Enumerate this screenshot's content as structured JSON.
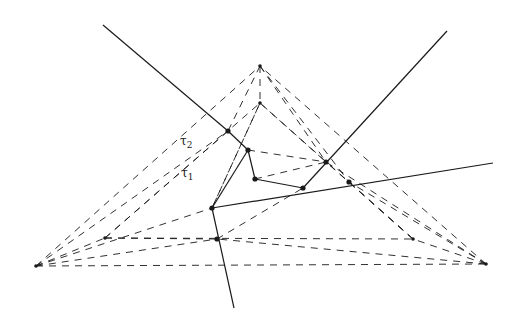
{
  "diagram": {
    "title": "",
    "colors": {
      "stroke": "#1a1a1a",
      "background": "#ffffff"
    },
    "labels": [
      {
        "id": "tau2",
        "base": "τ",
        "sub": "2",
        "x": 180,
        "y": 134
      },
      {
        "id": "tau1",
        "base": "τ",
        "sub": "1",
        "x": 181,
        "y": 166
      }
    ],
    "outer_triangle": [
      [
        36,
        266
      ],
      [
        486,
        264
      ],
      [
        260,
        66
      ]
    ],
    "inner_triangle": [
      [
        105,
        238
      ],
      [
        413,
        239
      ],
      [
        260,
        103
      ]
    ],
    "solid_lines": [
      [
        [
          103,
          25
        ],
        [
          228,
          131
        ]
      ],
      [
        [
          228,
          131
        ],
        [
          248,
          150
        ]
      ],
      [
        [
          248,
          150
        ],
        [
          255,
          179
        ]
      ],
      [
        [
          255,
          179
        ],
        [
          303,
          188
        ]
      ],
      [
        [
          447,
          31
        ],
        [
          303,
          188
        ]
      ],
      [
        [
          212,
          208
        ],
        [
          493,
          163
        ]
      ],
      [
        [
          212,
          208
        ],
        [
          248,
          150
        ]
      ],
      [
        [
          212,
          208
        ],
        [
          234,
          308
        ]
      ]
    ],
    "dashed_lines": [
      [
        [
          36,
          266
        ],
        [
          486,
          264
        ]
      ],
      [
        [
          36,
          266
        ],
        [
          260,
          66
        ]
      ],
      [
        [
          486,
          264
        ],
        [
          260,
          66
        ]
      ],
      [
        [
          105,
          238
        ],
        [
          413,
          239
        ]
      ],
      [
        [
          105,
          238
        ],
        [
          260,
          103
        ]
      ],
      [
        [
          413,
          239
        ],
        [
          260,
          103
        ]
      ],
      [
        [
          36,
          266
        ],
        [
          105,
          238
        ]
      ],
      [
        [
          486,
          264
        ],
        [
          413,
          239
        ]
      ],
      [
        [
          260,
          66
        ],
        [
          260,
          103
        ]
      ],
      [
        [
          36,
          266
        ],
        [
          228,
          131
        ]
      ],
      [
        [
          105,
          238
        ],
        [
          228,
          131
        ]
      ],
      [
        [
          260,
          66
        ],
        [
          228,
          131
        ]
      ],
      [
        [
          260,
          66
        ],
        [
          326,
          162
        ]
      ],
      [
        [
          260,
          103
        ],
        [
          212,
          208
        ]
      ],
      [
        [
          260,
          103
        ],
        [
          326,
          162
        ]
      ],
      [
        [
          486,
          264
        ],
        [
          326,
          162
        ]
      ],
      [
        [
          413,
          239
        ],
        [
          326,
          162
        ]
      ],
      [
        [
          248,
          150
        ],
        [
          326,
          162
        ]
      ],
      [
        [
          255,
          179
        ],
        [
          326,
          162
        ]
      ],
      [
        [
          36,
          266
        ],
        [
          212,
          208
        ]
      ],
      [
        [
          105,
          238
        ],
        [
          217,
          239
        ]
      ],
      [
        [
          486,
          264
        ],
        [
          349,
          182
        ]
      ],
      [
        [
          413,
          239
        ],
        [
          349,
          182
        ]
      ],
      [
        [
          260,
          66
        ],
        [
          349,
          182
        ]
      ],
      [
        [
          217,
          239
        ],
        [
          303,
          188
        ]
      ],
      [
        [
          36,
          266
        ],
        [
          217,
          239
        ]
      ],
      [
        [
          486,
          264
        ],
        [
          217,
          239
        ]
      ],
      [
        [
          212,
          208
        ],
        [
          260,
          103
        ]
      ]
    ],
    "points": [
      [
        228,
        131
      ],
      [
        248,
        150
      ],
      [
        255,
        179
      ],
      [
        326,
        162
      ],
      [
        303,
        188
      ],
      [
        349,
        182
      ],
      [
        212,
        208
      ],
      [
        217,
        239
      ]
    ]
  }
}
